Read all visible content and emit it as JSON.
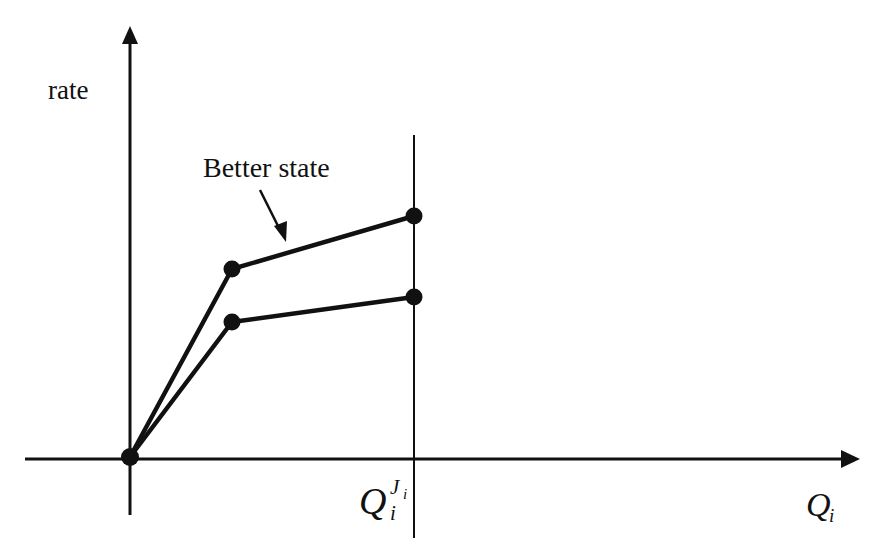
{
  "diagram": {
    "y_axis_label": "rate",
    "x_axis_label": "Q",
    "x_axis_label_sub": "i",
    "threshold_label": "Q",
    "threshold_label_sub": "i",
    "threshold_label_sup": "J",
    "threshold_label_sup_sub": "i",
    "annotation": "Better state",
    "line_color": "#111111",
    "series": [
      {
        "name": "Better state",
        "points": [
          [
            0,
            0
          ],
          [
            1,
            3.5
          ],
          [
            3,
            4.6
          ]
        ]
      },
      {
        "name": "Baseline state",
        "points": [
          [
            0,
            0
          ],
          [
            1,
            2.5
          ],
          [
            3,
            3.0
          ]
        ]
      }
    ]
  }
}
